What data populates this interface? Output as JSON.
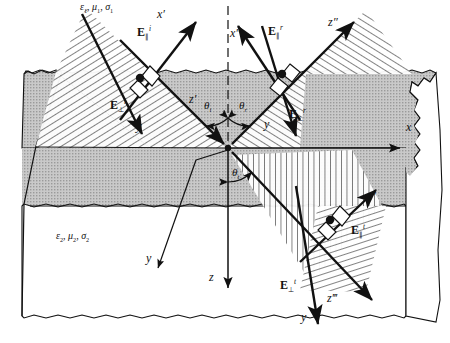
{
  "figure": {
    "kind": "oblique-incidence-plane-wave-reflection-refraction-diagram"
  },
  "colors": {
    "ink": "#111111",
    "paper": "#ffffff",
    "slab_top_fill": "#bdbdbd",
    "slab_side_fill": "#d2d2d2",
    "hatch_fill": "#ffffff",
    "medium2_fill": "#ffffff"
  },
  "media": {
    "upper": {
      "label": "ε1, μ1, σ1",
      "eps": "ε",
      "mu": "μ",
      "sigma": "σ",
      "index": "1"
    },
    "lower": {
      "label": "ε2, μ2, σ2",
      "eps": "ε",
      "mu": "μ",
      "sigma": "σ",
      "index": "2"
    }
  },
  "angles": [
    {
      "name": "theta-incident",
      "label": "θ",
      "subscript": "i",
      "x": 206,
      "y": 104
    },
    {
      "name": "theta-reflected",
      "label": "θ",
      "subscript": "r",
      "x": 240,
      "y": 104
    },
    {
      "name": "theta-transmitted",
      "label": "θ",
      "subscript": "t",
      "x": 233,
      "y": 171
    }
  ],
  "global_axes": [
    {
      "name": "axis-x",
      "label": "x",
      "primes": "",
      "x": 406,
      "y": 121
    },
    {
      "name": "axis-z",
      "label": "z",
      "primes": "",
      "x": 209,
      "y": 271
    }
  ],
  "incident": {
    "axis_x": {
      "label": "x",
      "primes": "′",
      "x": 159,
      "y": 12
    },
    "axis_z": {
      "label": "z",
      "primes": "′",
      "x": 192,
      "y": 97
    },
    "axis_y": {
      "label": "y",
      "primes": "",
      "x": 137,
      "y": 125
    },
    "E_parallel": {
      "base": "E",
      "sub": "∥",
      "sup": "i",
      "x": 140,
      "y": 30
    },
    "E_perp": {
      "base": "E",
      "sub": "⊥",
      "sup": "i",
      "x": 113,
      "y": 103
    }
  },
  "reflected": {
    "axis_x": {
      "label": "x",
      "primes": "″",
      "x": 232,
      "y": 31
    },
    "axis_z": {
      "label": "z",
      "primes": "″",
      "x": 330,
      "y": 20
    },
    "axis_y": {
      "label": "y",
      "primes": "",
      "x": 265,
      "y": 123
    },
    "E_parallel": {
      "base": "E",
      "sub": "∥",
      "sup": "r",
      "x": 271,
      "y": 28
    },
    "E_perp": {
      "base": "E",
      "sub": "⊥",
      "sup": "r",
      "x": 291,
      "y": 112
    }
  },
  "transmitted": {
    "axis_x": {
      "label": "x",
      "primes": "‴",
      "x": 368,
      "y": 195
    },
    "axis_z": {
      "label": "z",
      "primes": "‴",
      "x": 330,
      "y": 297
    },
    "axis_y": {
      "label": "y",
      "primes": "",
      "x": 302,
      "y": 316
    },
    "E_parallel": {
      "base": "E",
      "sub": "∥",
      "sup": "t",
      "x": 354,
      "y": 228
    },
    "E_perp": {
      "base": "E",
      "sub": "⊥",
      "sup": "t",
      "x": 283,
      "y": 283
    }
  },
  "geometry": {
    "origin": {
      "x": 228,
      "y": 148
    },
    "interface_note": "horizontal plane through origin; perpendicular dashed normal runs vertically upward"
  }
}
